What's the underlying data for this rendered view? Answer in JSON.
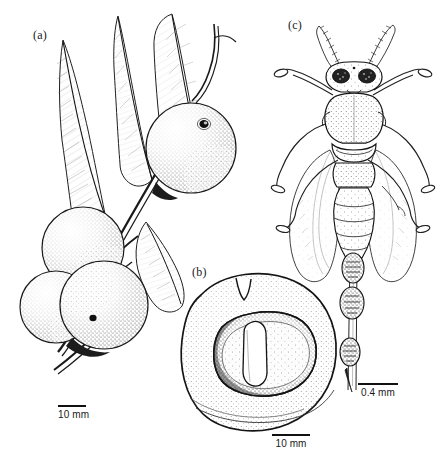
{
  "figure": {
    "width": 436,
    "height": 465,
    "background_color": "#ffffff",
    "ink_color": "#1a1a1a",
    "style": "pen-and-ink stipple scientific illustration"
  },
  "panels": [
    {
      "id": "a",
      "label": "(a)",
      "label_x": 33,
      "label_y": 30,
      "subject": "fig-branch-with-leaves-and-syconia",
      "description": "Branch bearing lanceolate leaves and four globose figs (syconia), one with dark apical ostiole",
      "scalebar": {
        "name": "scalebar-a",
        "text": "10 mm",
        "x": 58,
        "y": 407,
        "bar_length": 28
      }
    },
    {
      "id": "b",
      "label": "(b)",
      "label_x": 192,
      "label_y": 267,
      "subject": "fig-longitudinal-section",
      "description": "Sectioned syconium showing thick stippled wall, inner cavity and central columnar structure",
      "scalebar": {
        "name": "scalebar-b",
        "text": "10 mm",
        "x": 272,
        "y": 436,
        "bar_length": 38
      }
    },
    {
      "id": "c",
      "label": "(c)",
      "label_x": 288,
      "label_y": 20,
      "subject": "fig-wasp-dorsal-view",
      "description": "Dorsal view of female fig wasp with segmented antennae, dark compound eyes, two pairs of fringed wings, six legs and a long segmented ovipositor with three swellings",
      "scalebar": {
        "name": "scalebar-c",
        "text": "0.4 mm",
        "x": 358,
        "y": 385,
        "bar_length": 40
      }
    }
  ]
}
